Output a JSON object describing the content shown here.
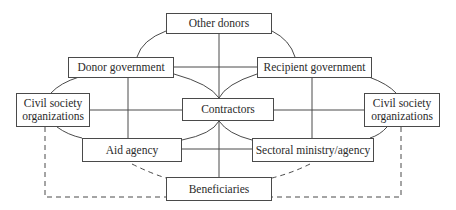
{
  "diagram": {
    "type": "stakeholder-network",
    "colors": {
      "line": "#4a4a4a",
      "text": "#2a2a2a",
      "background": "#ffffff"
    },
    "nodes": {
      "other_donors": {
        "label": "Other donors"
      },
      "donor_government": {
        "label": "Donor government"
      },
      "recipient_government": {
        "label": "Recipient government"
      },
      "civil_society_left": {
        "line1": "Civil society",
        "line2": "organizations"
      },
      "contractors": {
        "label": "Contractors"
      },
      "civil_society_right": {
        "line1": "Civil society",
        "line2": "organizations"
      },
      "aid_agency": {
        "label": "Aid agency"
      },
      "sectoral_ministry": {
        "label": "Sectoral ministry/agency"
      },
      "beneficiaries": {
        "label": "Beneficiaries"
      }
    },
    "connections": {
      "solid": [
        [
          "other_donors",
          "donor_government"
        ],
        [
          "other_donors",
          "recipient_government"
        ],
        [
          "other_donors",
          "contractors"
        ],
        [
          "donor_government",
          "recipient_government"
        ],
        [
          "donor_government",
          "contractors"
        ],
        [
          "donor_government",
          "civil_society_left"
        ],
        [
          "donor_government",
          "aid_agency"
        ],
        [
          "recipient_government",
          "contractors"
        ],
        [
          "recipient_government",
          "civil_society_right"
        ],
        [
          "recipient_government",
          "sectoral_ministry"
        ],
        [
          "civil_society_left",
          "contractors"
        ],
        [
          "civil_society_left",
          "aid_agency"
        ],
        [
          "contractors",
          "civil_society_right"
        ],
        [
          "contractors",
          "aid_agency"
        ],
        [
          "contractors",
          "sectoral_ministry"
        ],
        [
          "contractors",
          "beneficiaries"
        ],
        [
          "aid_agency",
          "sectoral_ministry"
        ],
        [
          "sectoral_ministry",
          "civil_society_right"
        ]
      ],
      "dashed": [
        [
          "aid_agency",
          "beneficiaries"
        ],
        [
          "sectoral_ministry",
          "beneficiaries"
        ],
        [
          "civil_society_left",
          "beneficiaries"
        ],
        [
          "civil_society_right",
          "beneficiaries"
        ]
      ]
    }
  }
}
